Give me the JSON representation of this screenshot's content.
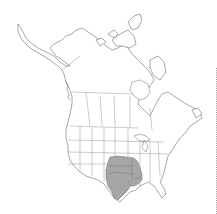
{
  "map": {
    "title": "",
    "region": "North America",
    "colors": {
      "background": "#ffffff",
      "land_fill": "#ffffff",
      "outline": "#6b6b6b",
      "range_fill": "#a6a6a6",
      "edge_dotted_line": "#9a9a9a"
    },
    "range": {
      "label": "",
      "areas": [
        "Texas",
        "Oklahoma",
        "Kansas",
        "Missouri",
        "Arkansas",
        "Louisiana"
      ]
    }
  }
}
